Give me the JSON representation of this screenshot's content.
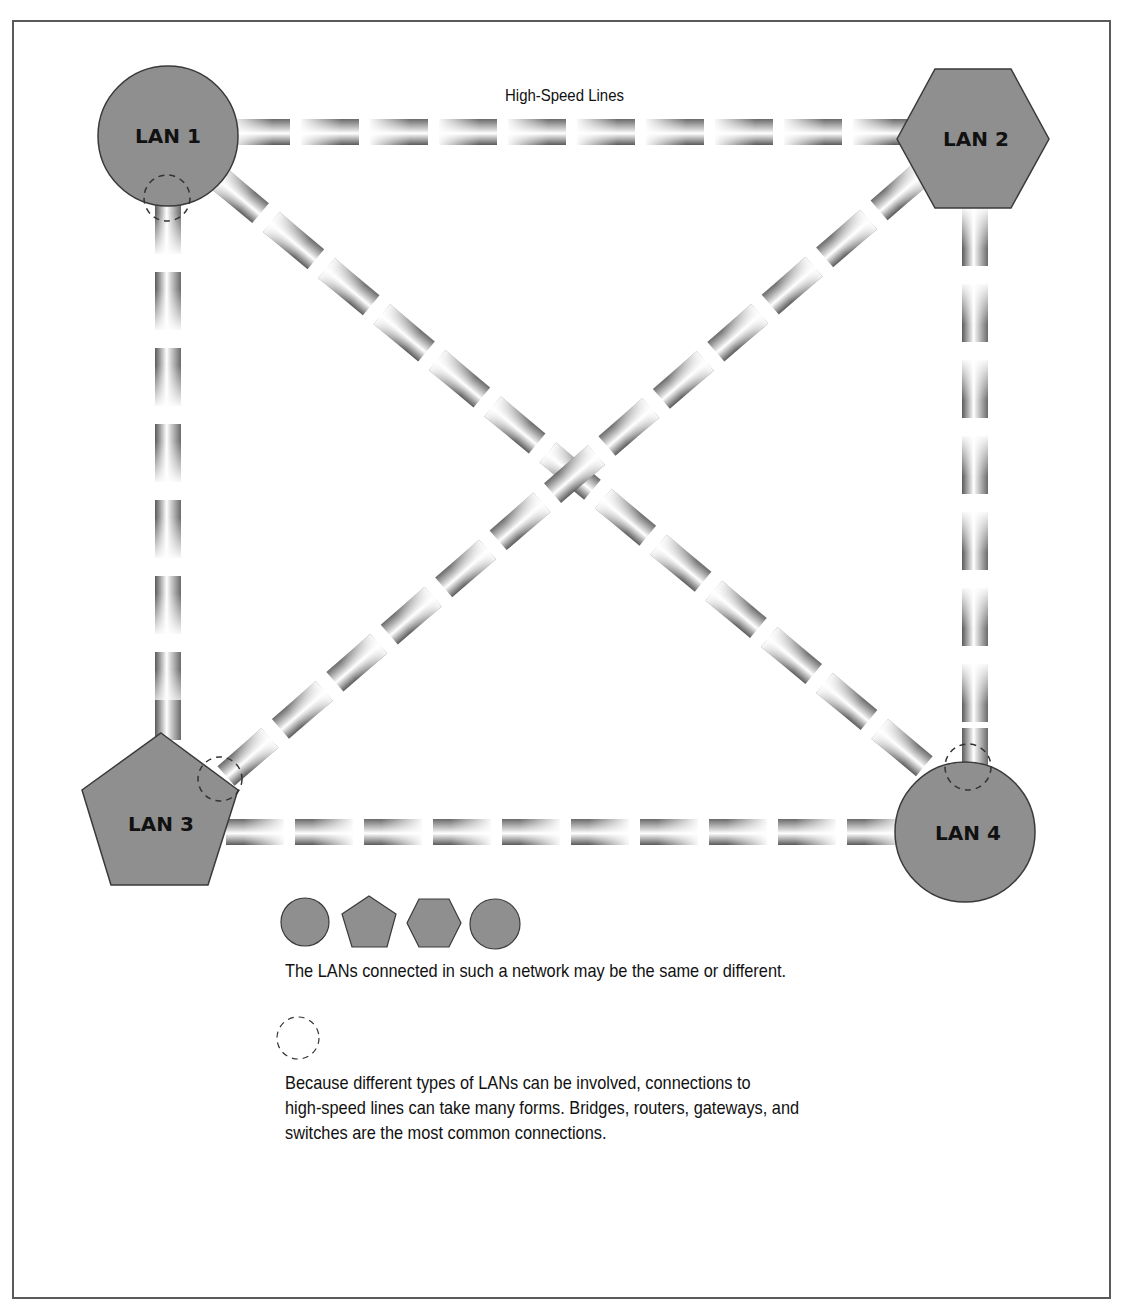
{
  "diagram": {
    "title": "High-Speed Lines",
    "nodes": [
      {
        "id": "lan1",
        "label": "LAN 1",
        "shape": "circle"
      },
      {
        "id": "lan2",
        "label": "LAN 2",
        "shape": "hexagon"
      },
      {
        "id": "lan3",
        "label": "LAN 3",
        "shape": "pentagon"
      },
      {
        "id": "lan4",
        "label": "LAN 4",
        "shape": "circle"
      }
    ],
    "edges": [
      {
        "from": "lan1",
        "to": "lan2",
        "type": "high-speed-line"
      },
      {
        "from": "lan1",
        "to": "lan3",
        "type": "high-speed-line"
      },
      {
        "from": "lan1",
        "to": "lan4",
        "type": "high-speed-line"
      },
      {
        "from": "lan2",
        "to": "lan3",
        "type": "high-speed-line"
      },
      {
        "from": "lan2",
        "to": "lan4",
        "type": "high-speed-line"
      },
      {
        "from": "lan3",
        "to": "lan4",
        "type": "high-speed-line"
      }
    ],
    "connection_markers": [
      "lan1-bottom",
      "lan3-upper-right",
      "lan4-top"
    ],
    "colors": {
      "node_fill": "#8f8f8f",
      "node_stroke": "#3a3a3a",
      "pipe_dark": "#555555",
      "pipe_light": "#ffffff",
      "frame": "#5a5a5a"
    }
  },
  "legend": {
    "shapes": [
      "circle",
      "pentagon",
      "hexagon",
      "circle"
    ],
    "shapes_caption": "The LANs connected in such a network may be the same or different.",
    "connection_marker": "dashed-circle",
    "connection_caption_lines": [
      "Because different types of LANs can be involved, connections to",
      "high-speed lines can take many forms. Bridges, routers, gateways, and",
      "switches are the most common connections."
    ]
  }
}
